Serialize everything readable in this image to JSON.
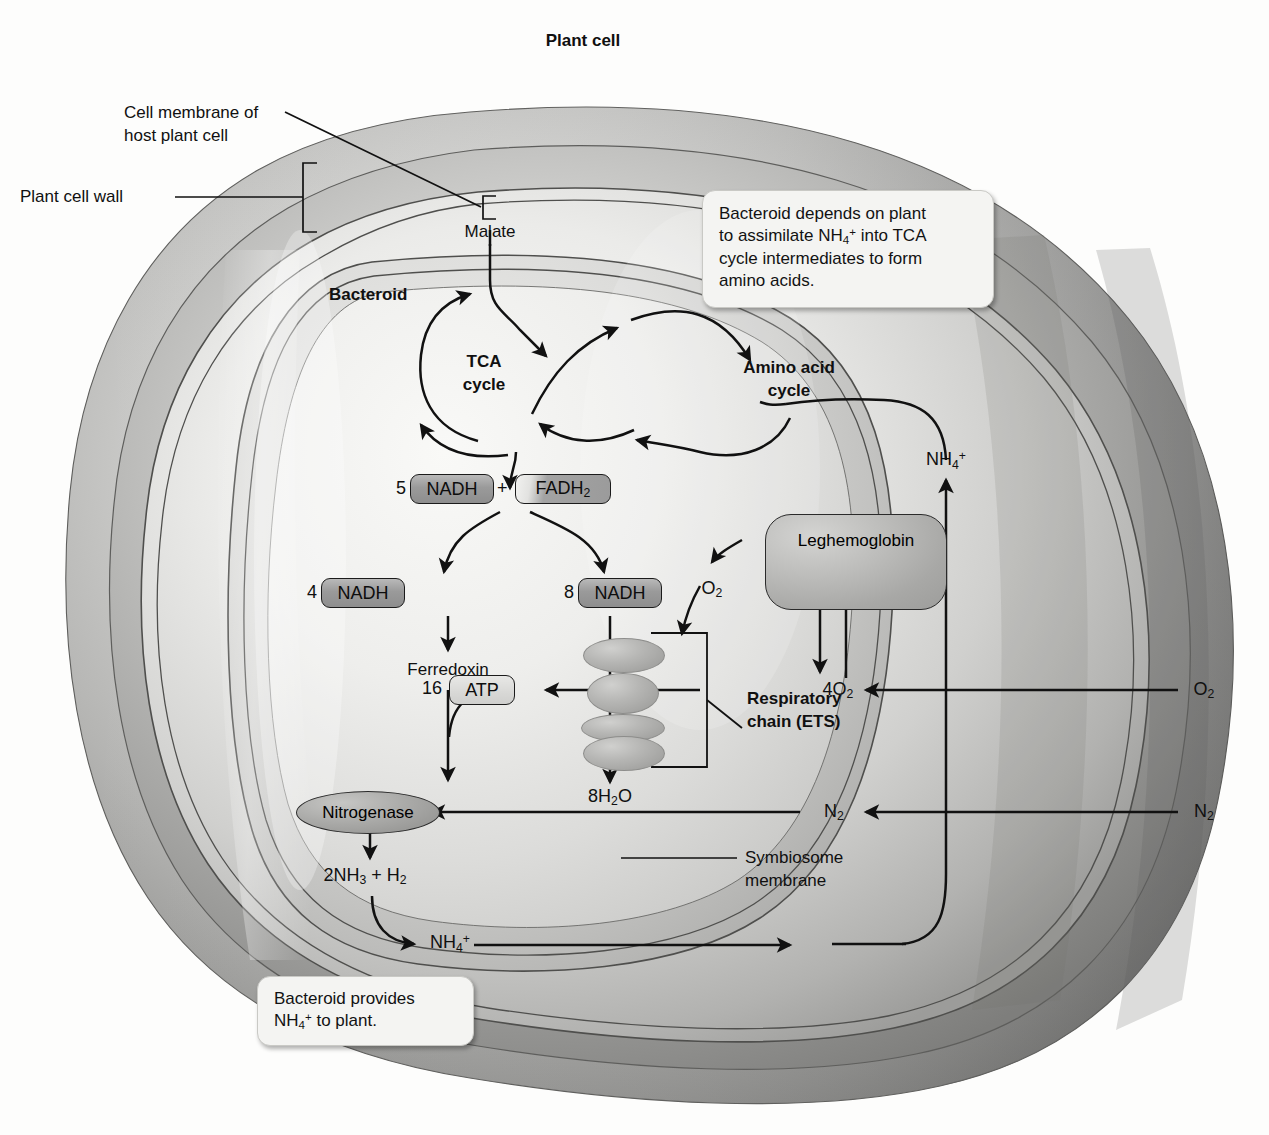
{
  "title": "Plant cell",
  "labels": {
    "plant_cell": "Plant cell",
    "cell_membrane": "Cell membrane of\nhost plant cell",
    "cell_membrane_l1": "Cell membrane of",
    "cell_membrane_l2": "host plant cell",
    "plant_cell_wall": "Plant cell wall",
    "malate": "Malate",
    "bacteroid": "Bacteroid",
    "tca_l1": "TCA",
    "tca_l2": "cycle",
    "amino_l1": "Amino acid",
    "amino_l2": "cycle",
    "ferredoxin": "Ferredoxin",
    "resp_l1": "Respiratory",
    "resp_l2": "chain (ETS)",
    "symb_l1": "Symbiosome",
    "symb_l2": "membrane",
    "leghemoglobin": "Leghemoglobin",
    "nitrogenase": "Nitrogenase"
  },
  "chips": {
    "nadh5_coeff": "5",
    "nadh5": "NADH",
    "plus": "+",
    "fadh2": "FADH",
    "fadh2_sub": "2",
    "nadh4_coeff": "4",
    "nadh4": "NADH",
    "nadh8_coeff": "8",
    "nadh8": "NADH",
    "atp_coeff": "16",
    "atp": "ATP"
  },
  "molecules": {
    "o2_small": "O",
    "o2_small_sub": "2",
    "o2_4_coeff": "4",
    "o2_4": "O",
    "o2_4_sub": "2",
    "o2_outer": "O",
    "o2_outer_sub": "2",
    "n2_inner": "N",
    "n2_inner_sub": "2",
    "n2_outer": "N",
    "n2_outer_sub": "2",
    "h2o_coeff": "8",
    "h2o": "H",
    "h2o_sub": "2",
    "h2o_o": "O",
    "nh3_coeff": "2",
    "nh3": "NH",
    "nh3_sub": "3",
    "nh3_plus": "+ H",
    "nh3_plus_sub": "2",
    "nh4_bottom": "NH",
    "nh4_bottom_sub": "4",
    "nh4_bottom_sup": "+",
    "nh4_right": "NH",
    "nh4_right_sub": "4",
    "nh4_right_sup": "+"
  },
  "callouts": {
    "top": {
      "line1": "Bacteroid depends on plant",
      "line2_a": "to assimilate NH",
      "line2_sub": "4",
      "line2_sup": "+",
      "line2_b": " into TCA",
      "line3": "cycle intermediates to form",
      "line4": "amino acids."
    },
    "bottom": {
      "line1": "Bacteroid provides",
      "line2_a": "NH",
      "line2_sub": "4",
      "line2_sup": "+",
      "line2_b": " to plant."
    }
  },
  "colors": {
    "ink": "#101010",
    "chip_dark": "#9a9a9a",
    "chip_light": "#d8d8d6",
    "callout_bg": "#f4f4f2",
    "membrane_line": "#5a5a58",
    "page_bg": "#fdfdfc"
  }
}
